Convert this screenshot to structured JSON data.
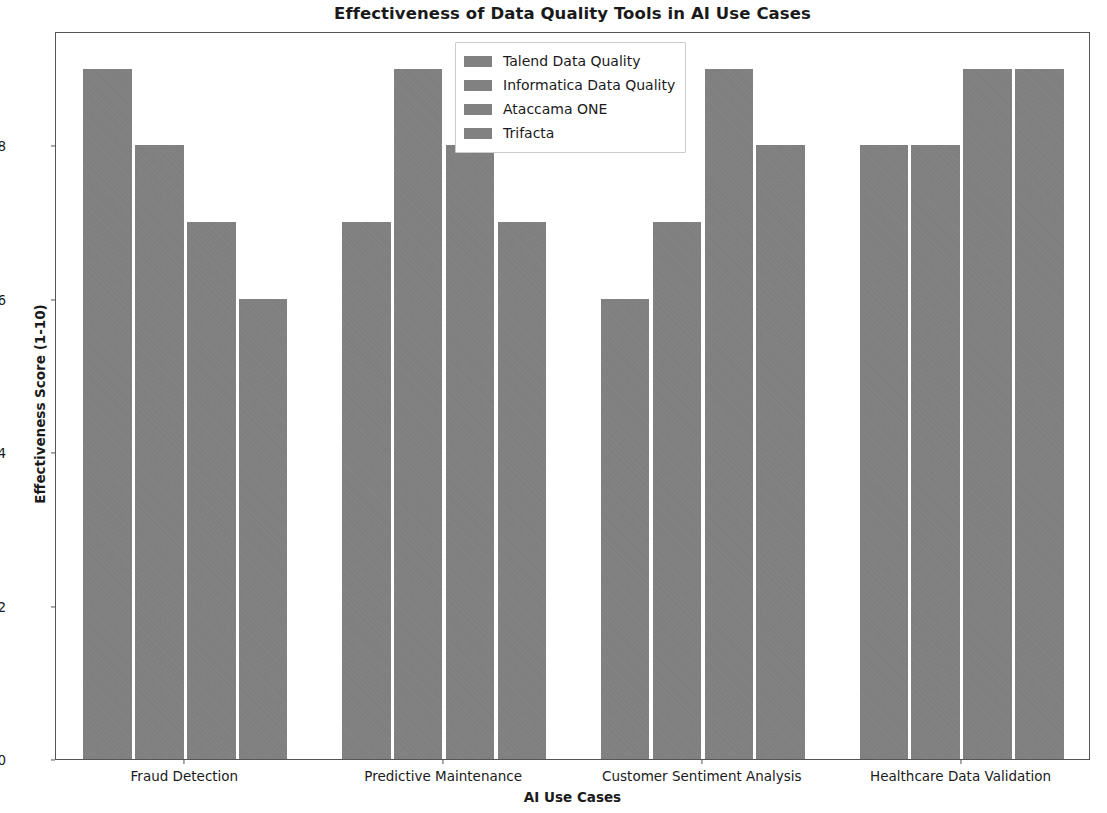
{
  "chart_data": {
    "type": "bar",
    "title": "Effectiveness of Data Quality Tools in AI Use Cases",
    "xlabel": "AI Use Cases",
    "ylabel": "Effectiveness Score (1-10)",
    "categories": [
      "Fraud Detection",
      "Predictive Maintenance",
      "Customer Sentiment Analysis",
      "Healthcare Data Validation"
    ],
    "series": [
      {
        "name": "Talend Data Quality",
        "values": [
          9,
          7,
          6,
          8
        ]
      },
      {
        "name": "Informatica Data Quality",
        "values": [
          8,
          9,
          7,
          8
        ]
      },
      {
        "name": "Ataccama ONE",
        "values": [
          7,
          8,
          9,
          9
        ]
      },
      {
        "name": "Trifacta",
        "values": [
          6,
          7,
          8,
          9
        ]
      }
    ],
    "ylim": [
      0,
      9.49
    ],
    "yticks": [
      0,
      2,
      4,
      6,
      8
    ],
    "ytick_labels": [
      "0",
      "2",
      "4",
      "6",
      "8"
    ],
    "grid": false,
    "legend_position": "upper center",
    "bar_color": "#828282",
    "axis_color": "#555555",
    "text_color": "#1a1a1a",
    "background": "#ffffff"
  },
  "legend": {
    "entries": [
      "Talend Data Quality",
      "Informatica Data Quality",
      "Ataccama ONE",
      "Trifacta"
    ]
  }
}
